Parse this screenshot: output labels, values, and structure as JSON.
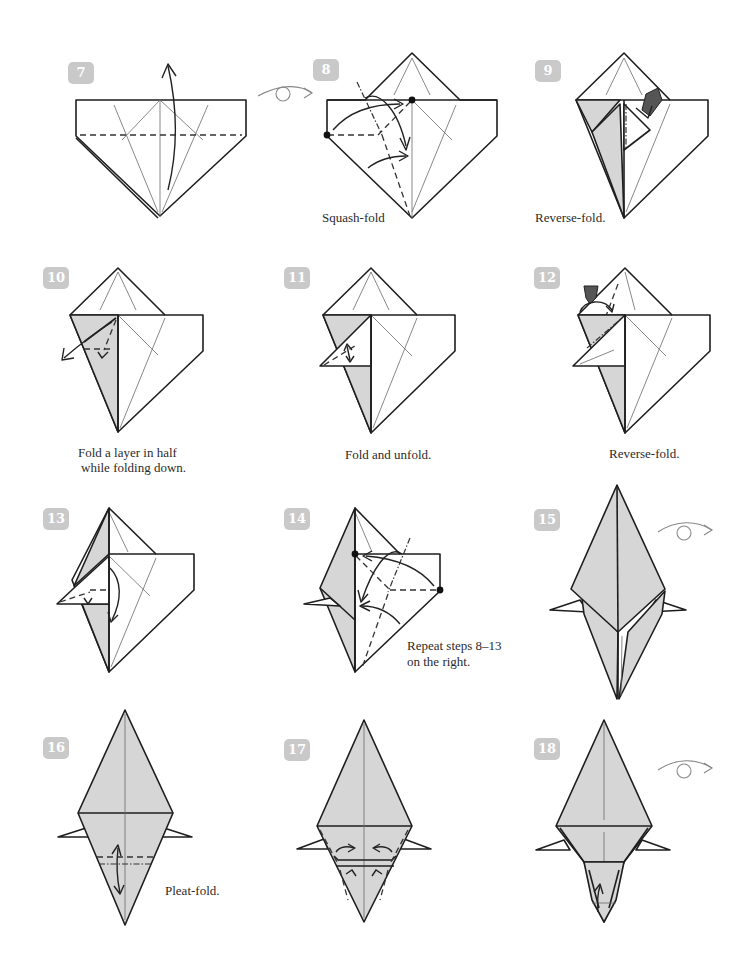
{
  "page": {
    "background": "#ffffff",
    "paper_white": "#ffffff",
    "paper_colored": "#d6d6d6",
    "badge_color": "#c9c9c9"
  },
  "steps": [
    {
      "number": "7",
      "caption": "",
      "symbols": [
        "valley-fold-line",
        "fold-up-arrow"
      ]
    },
    {
      "number": "8",
      "caption": "Squash-fold",
      "symbols": [
        "turn-over-icon",
        "valley-fold-line",
        "mountain-fold-line",
        "reference-dots",
        "squash-arrows"
      ]
    },
    {
      "number": "9",
      "caption": "Reverse-fold.",
      "symbols": [
        "push-arrow",
        "mountain-fold-line"
      ]
    },
    {
      "number": "10",
      "caption_lines": [
        "Fold a layer in half",
        "while folding down."
      ],
      "symbols": [
        "fold-down-arrow",
        "valley-fold-line"
      ]
    },
    {
      "number": "11",
      "caption": "Fold and unfold.",
      "symbols": [
        "fold-unfold-arrow",
        "valley-fold-line"
      ]
    },
    {
      "number": "12",
      "caption": "Reverse-fold.",
      "symbols": [
        "push-arrow",
        "valley-fold-line",
        "mountain-fold-line"
      ]
    },
    {
      "number": "13",
      "caption": "",
      "symbols": [
        "fold-down-arrow",
        "valley-fold-line"
      ]
    },
    {
      "number": "14",
      "caption_lines": [
        "Repeat steps 8–13",
        "on the right."
      ],
      "symbols": [
        "reference-dots",
        "squash-arrows",
        "valley-fold-line",
        "mountain-fold-line"
      ]
    },
    {
      "number": "15",
      "caption": "",
      "symbols": [
        "turn-over-icon"
      ]
    },
    {
      "number": "16",
      "caption": "Pleat-fold.",
      "symbols": [
        "valley-fold-line",
        "mountain-fold-line",
        "pleat-arrow"
      ]
    },
    {
      "number": "17",
      "caption": "",
      "symbols": [
        "valley-fold-line",
        "fold-in-arrows"
      ]
    },
    {
      "number": "18",
      "caption": "",
      "symbols": [
        "turn-over-icon",
        "fold-up-arrow"
      ]
    }
  ]
}
